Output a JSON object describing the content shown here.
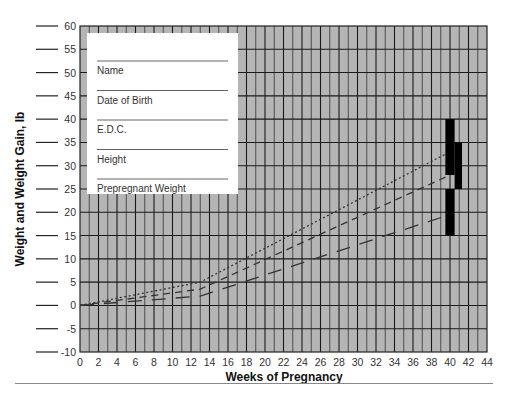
{
  "chart_data": {
    "type": "line",
    "title": "",
    "xlabel": "Weeks of Pregnancy",
    "ylabel": "Weight and Weight Gain, lb",
    "xlim": [
      0,
      44
    ],
    "ylim": [
      -10,
      60
    ],
    "x_ticks": [
      0,
      2,
      4,
      6,
      8,
      10,
      12,
      14,
      16,
      18,
      20,
      22,
      24,
      26,
      28,
      30,
      32,
      34,
      36,
      38,
      40,
      42,
      44
    ],
    "y_ticks": [
      -10,
      -5,
      0,
      5,
      10,
      15,
      20,
      25,
      30,
      35,
      40,
      45,
      50,
      55,
      60
    ],
    "grid": true,
    "grid_style": "vertical lines every week, horizontal lines every 5 lb, gray background",
    "series": [
      {
        "name": "Dotted line",
        "style": "dotted",
        "points": [
          [
            0,
            0
          ],
          [
            13,
            5
          ],
          [
            40,
            33
          ]
        ]
      },
      {
        "name": "Short-dashed line",
        "style": "dashed",
        "points": [
          [
            0,
            0
          ],
          [
            13,
            3.5
          ],
          [
            40,
            28
          ]
        ]
      },
      {
        "name": "Long-dashed line",
        "style": "long-dashed",
        "points": [
          [
            0,
            0
          ],
          [
            13,
            2
          ],
          [
            40,
            19.5
          ]
        ]
      }
    ],
    "range_bars": [
      {
        "week_start": 39.5,
        "week_end": 40.5,
        "low": 28,
        "high": 40
      },
      {
        "week_start": 40.5,
        "week_end": 41.3,
        "low": 25,
        "high": 35
      },
      {
        "week_start": 39.5,
        "week_end": 40.5,
        "low": 15,
        "high": 25
      }
    ],
    "colors": {
      "background": "#b3b3b3",
      "grid": "#222222",
      "lines": "#333333",
      "bars": "#000000"
    }
  },
  "inset_form": {
    "fields": [
      "Name",
      "Date of Birth",
      "E.D.C.",
      "Height",
      "Prepregnant Weight"
    ]
  }
}
